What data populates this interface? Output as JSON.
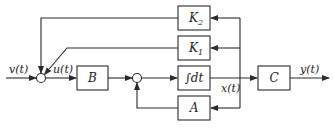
{
  "diagram": {
    "title": "",
    "signals": {
      "input": "v(t)",
      "control": "u(t)",
      "state": "x(t)",
      "output": "y(t)"
    },
    "blocks": {
      "B": "B",
      "integrator": "∫dt",
      "C": "C",
      "A": "A",
      "K1": {
        "base": "K",
        "sub": "1"
      },
      "K2": {
        "base": "K",
        "sub": "2"
      }
    },
    "junctions": [
      "sum-1",
      "sum-2"
    ],
    "colors": {
      "line": "#2b2b2b",
      "background": "#ffffff"
    }
  }
}
